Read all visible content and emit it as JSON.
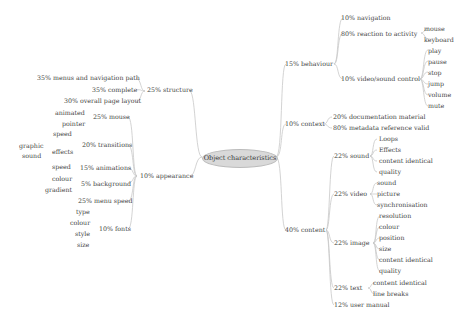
{
  "root": {
    "label": "Object characteristics",
    "color": "#d9d9d9"
  },
  "branches": {
    "structure": {
      "label": "25% structure",
      "children": [
        "35% menus and navigation path",
        "35% complete",
        "30% overall page layout"
      ]
    },
    "appearance": {
      "label": "10% appearance",
      "mouse": {
        "label": "25% mouse",
        "children": [
          "animated",
          "pointer"
        ]
      },
      "transitions": {
        "label": "20% transitions",
        "children": [
          "speed",
          "effects"
        ],
        "effects_children": [
          "graphic",
          "sound"
        ]
      },
      "animations": {
        "label": "15% animations",
        "children": [
          "speed"
        ]
      },
      "background": {
        "label": "5% background",
        "children": [
          "colour",
          "gradient"
        ]
      },
      "menu_speed": {
        "label": "25% menu speed"
      },
      "fonts": {
        "label": "10% fonts",
        "children": [
          "type",
          "colour",
          "style",
          "size"
        ]
      }
    },
    "behaviour": {
      "label": "15% behaviour",
      "navigation": {
        "label": "10% navigation"
      },
      "reaction": {
        "label": "80% reaction to activity",
        "children": [
          "mouse",
          "keyboard"
        ]
      },
      "video_sound": {
        "label": "10% video/sound control",
        "children": [
          "play",
          "pause",
          "stop",
          "jump",
          "volume",
          "mute"
        ]
      }
    },
    "context": {
      "label": "10% context",
      "children": [
        "20% documentation material",
        "80% metadata reference valid"
      ]
    },
    "content": {
      "label": "40% content",
      "sound": {
        "label": "22% sound",
        "children": [
          "Loops",
          "Effects",
          "content identical",
          "quality"
        ]
      },
      "video": {
        "label": "22% video",
        "children": [
          "sound",
          "picture",
          "synchronisation"
        ]
      },
      "image": {
        "label": "22% image",
        "children": [
          "resolution",
          "colour",
          "position",
          "size",
          "content identical",
          "quality"
        ]
      },
      "text": {
        "label": "22% text",
        "children": [
          "content identical",
          "line breaks"
        ]
      },
      "manual": {
        "label": "12% user manual"
      }
    }
  }
}
